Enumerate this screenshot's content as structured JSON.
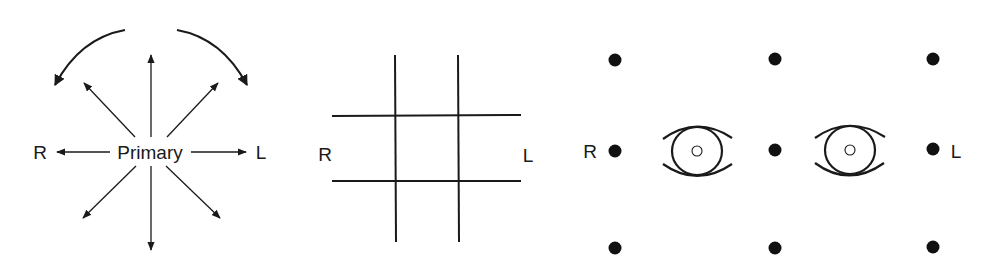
{
  "panels": {
    "gaze_directions": {
      "center_label": "Primary",
      "left_label": "R",
      "right_label": "L",
      "arrows": [
        "up",
        "down",
        "left",
        "right",
        "up-left",
        "up-right",
        "down-left",
        "down-right"
      ],
      "rotation_arrows": [
        "counterclockwise-left",
        "clockwise-right"
      ]
    },
    "grid": {
      "left_label": "R",
      "right_label": "L",
      "vertical_lines": 2,
      "horizontal_lines": 2
    },
    "nine_positions": {
      "left_label": "R",
      "right_label": "L",
      "dots": 9,
      "eyes": 2
    }
  },
  "colors": {
    "ink": "#1a1a1a",
    "background": "#ffffff"
  }
}
